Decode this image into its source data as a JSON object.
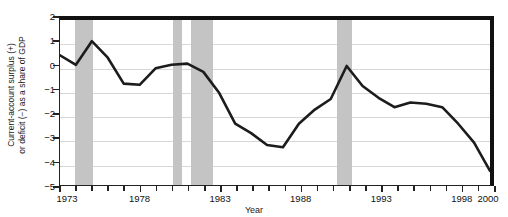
{
  "chart_data": {
    "type": "line",
    "title": "",
    "xlabel": "Year",
    "ylabel_line1": "Current-account surplus (+)",
    "ylabel_line2": "or deficit (−) as a share of GDP",
    "xlim": [
      1973,
      2000
    ],
    "ylim": [
      -5,
      2
    ],
    "grid": true,
    "legend": "none",
    "yticks": [
      2,
      1,
      0,
      -1,
      -2,
      -3,
      -4,
      -5
    ],
    "ytick_labels": [
      "2",
      "1",
      "0",
      "−1",
      "−2",
      "−3",
      "−4",
      "−5"
    ],
    "xticks": [
      1973,
      1974,
      1975,
      1976,
      1977,
      1978,
      1979,
      1980,
      1981,
      1982,
      1983,
      1984,
      1985,
      1986,
      1987,
      1988,
      1989,
      1990,
      1991,
      1992,
      1993,
      1994,
      1995,
      1996,
      1997,
      1998,
      1999,
      2000
    ],
    "xtick_labels_shown": [
      "1973",
      "1978",
      "1983",
      "1988",
      "1993",
      "1998",
      "2000"
    ],
    "series": [
      {
        "name": "Current account balance (% of GDP)",
        "color": "#1c1c1c",
        "x": [
          1973,
          1974,
          1975,
          1976,
          1977,
          1978,
          1979,
          1980,
          1981,
          1982,
          1983,
          1984,
          1985,
          1986,
          1987,
          1988,
          1989,
          1990,
          1991,
          1992,
          1993,
          1994,
          1995,
          1996,
          1997,
          1998,
          1999,
          2000
        ],
        "values": [
          0.5,
          0.1,
          1.1,
          0.4,
          -0.7,
          -0.75,
          -0.05,
          0.1,
          0.15,
          -0.2,
          -1.1,
          -2.4,
          -2.8,
          -3.3,
          -3.4,
          -2.4,
          -1.8,
          -1.35,
          0.05,
          -0.8,
          -1.3,
          -1.7,
          -1.5,
          -1.55,
          -1.7,
          -2.4,
          -3.2,
          -4.4
        ]
      }
    ],
    "recession_bands": [
      {
        "start": 1973.95,
        "end": 1975.05
      },
      {
        "start": 1980.0,
        "end": 1980.6
      },
      {
        "start": 1981.1,
        "end": 1982.5
      },
      {
        "start": 1990.2,
        "end": 1991.1
      },
      {
        "start": 1999.7,
        "end": 2000.0
      }
    ],
    "recession_color": "#c4c4c4"
  }
}
